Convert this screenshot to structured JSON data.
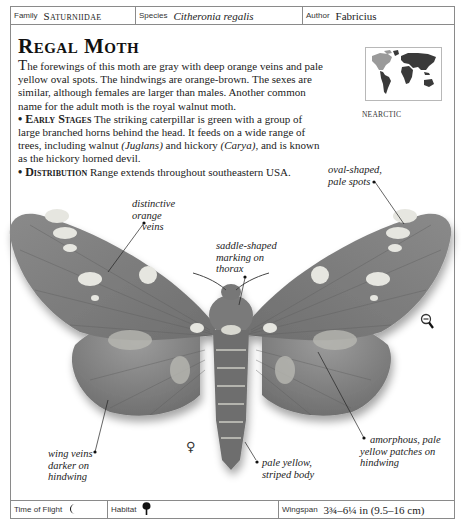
{
  "header": {
    "family_label": "Family",
    "family_value": "Saturniidae",
    "species_label": "Species",
    "species_value": "Citheronia regalis",
    "author_label": "Author",
    "author_value": "Fabricius"
  },
  "title": "Regal Moth",
  "description": {
    "intro_dropcap": "T",
    "intro_rest": "he forewings of this moth are gray with deep orange veins and pale yellow oval spots. The hindwings are orange-brown. The sexes are similar, although females are larger than males. Another common name for the adult moth is the royal walnut moth.",
    "early_stages_heading": "• Early Stages",
    "early_stages_text_1": " The striking caterpillar is green with a group of large branched horns behind the head. It feeds on a wide range of trees, including walnut ",
    "early_stages_juglans": "(Juglans)",
    "early_stages_text_2": " and hickory ",
    "early_stages_carya": "(Carya)",
    "early_stages_text_3": ", and is known as the hickory horned devil.",
    "distribution_heading": "• Distribution",
    "distribution_text": " Range extends throughout southeastern USA."
  },
  "map": {
    "caption": "NEARCTIC",
    "highlight_color": "#9a9a9a",
    "land_color": "#3a3a3a"
  },
  "annotations": {
    "orange_veins": "distinctive orange veins",
    "oval_spots": "oval-shaped, pale spots",
    "saddle_marking": "saddle-shaped marking on thorax",
    "wing_veins": "wing veins darker on hindwing",
    "striped_body": "pale yellow, striped body",
    "amorphous_patches": "amorphous, pale yellow patches on hindwing"
  },
  "annotation_lines": {
    "orange_veins_1": "distinctive",
    "orange_veins_2": "orange",
    "orange_veins_3": "veins",
    "oval_spots_1": "oval-shaped,",
    "oval_spots_2": "pale spots",
    "saddle_1": "saddle-shaped",
    "saddle_2": "marking on",
    "saddle_3": "thorax",
    "wing_veins_1": "wing veins",
    "wing_veins_2": "darker on",
    "wing_veins_3": "hindwing",
    "striped_1": "pale yellow,",
    "striped_2": "striped body",
    "amorphous_1": "amorphous, pale",
    "amorphous_2": "yellow patches on",
    "amorphous_3": "hindwing"
  },
  "gender_symbol": "♀",
  "footer": {
    "time_label": "Time of Flight",
    "time_icon": "moon-icon",
    "habitat_label": "Habitat",
    "habitat_icon": "tree-icon",
    "wingspan_label": "Wingspan",
    "wingspan_value": "3¾–6¼ in (9.5–16 cm)"
  },
  "controls": {
    "zoom_icon": "zoom-out-icon"
  }
}
